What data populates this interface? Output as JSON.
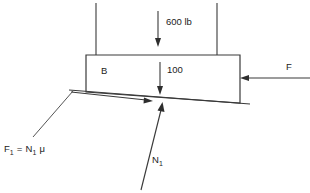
{
  "figure": {
    "type": "free-body-diagram",
    "background_color": "#ffffff",
    "line_color": "#3a3a3a",
    "text_color": "#222222",
    "width": 310,
    "height": 193
  },
  "body": {
    "label": "B",
    "shape": "quadrilateral-slab"
  },
  "forces": {
    "applied_load": {
      "label": "600 lb",
      "direction": "down"
    },
    "internal_load": {
      "label": "100",
      "direction": "down"
    },
    "push": {
      "label": "F",
      "direction": "left"
    },
    "friction": {
      "label_plain": "F1 = N1 μ",
      "symbol": "F",
      "symbol_sub": "1",
      "equals": "=",
      "normal_symbol": "N",
      "normal_sub": "1",
      "mu": "μ",
      "direction": "up-slope-right"
    },
    "normal": {
      "label_plain": "N1",
      "symbol": "N",
      "symbol_sub": "1",
      "direction": "perpendicular-to-surface"
    }
  },
  "supports": {
    "left_hanger_label": "",
    "right_hanger_label": ""
  }
}
